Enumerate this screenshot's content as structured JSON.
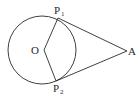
{
  "diagram": {
    "points": {
      "center": {
        "label": "O"
      },
      "tangent_point_1": {
        "label": "P",
        "subscript": "1"
      },
      "tangent_point_2": {
        "label": "P",
        "subscript": "2"
      },
      "external_point": {
        "label": "A"
      }
    },
    "segments": [
      {
        "from": "O",
        "to": "P1",
        "kind": "radius"
      },
      {
        "from": "O",
        "to": "P2",
        "kind": "radius"
      },
      {
        "from": "P1",
        "to": "A",
        "kind": "tangent"
      },
      {
        "from": "P2",
        "to": "A",
        "kind": "tangent"
      }
    ],
    "colors": {
      "ink": "#2a2a2a",
      "background": "#ffffff"
    }
  }
}
